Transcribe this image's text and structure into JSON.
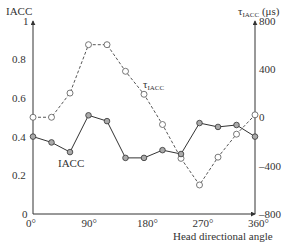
{
  "chart_data": {
    "type": "line",
    "title": "",
    "xlabel": "Head directional angle",
    "ylabel_left": "IACC",
    "ylabel_right": "τIACC (μs)",
    "x": [
      0,
      30,
      60,
      90,
      120,
      150,
      180,
      210,
      240,
      270,
      300,
      330,
      360
    ],
    "x_ticks": [
      "0°",
      "90°",
      "180°",
      "270°",
      "360°"
    ],
    "xlim": [
      0,
      360
    ],
    "ylim_left": [
      0,
      1
    ],
    "ylim_right": [
      -800,
      800
    ],
    "y_ticks_left": [
      "0",
      "0.2",
      "0.4",
      "0.6",
      "0.8",
      "1"
    ],
    "y_ticks_right": [
      "800",
      "400",
      "0",
      "-400",
      "-800"
    ],
    "grid": false,
    "series": [
      {
        "name": "IACC",
        "axis": "left",
        "style": "solid",
        "marker": "filled-circle",
        "values": [
          0.4,
          0.37,
          0.32,
          0.51,
          0.48,
          0.29,
          0.29,
          0.33,
          0.31,
          0.47,
          0.45,
          0.46,
          0.4
        ]
      },
      {
        "name": "τIACC",
        "axis": "right",
        "style": "dashed",
        "marker": "open-circle",
        "values": [
          0,
          0,
          200,
          600,
          600,
          380,
          190,
          -60,
          -340,
          -560,
          -330,
          -140,
          20
        ]
      }
    ],
    "annotations": [
      {
        "text": "IACC",
        "near_series": "IACC"
      },
      {
        "text": "τIACC",
        "near_series": "τIACC"
      }
    ]
  },
  "labels": {
    "left_axis_title": "IACC",
    "right_axis_title_main": "τ",
    "right_axis_title_sub": "IACC",
    "right_axis_title_unit": " (μs)",
    "x_axis_title": "Head directional angle",
    "series_label_iacc": "IACC",
    "series_label_tau_main": "τ",
    "series_label_tau_sub": "IACC"
  },
  "caption": "Fig. 12.14 Measured IACC and τIACC as a function of head directional angle"
}
